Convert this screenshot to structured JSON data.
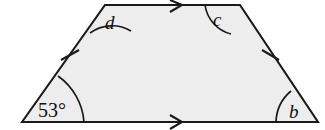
{
  "figure": {
    "kind": "isosceles-trapezoid",
    "fill_color": "#ededed",
    "stroke_color": "#1a1a1a",
    "background_color": "#ffffff",
    "vertices": {
      "bottom_left": {
        "x": 22,
        "y": 122
      },
      "top_left": {
        "x": 105,
        "y": 5
      },
      "top_right": {
        "x": 240,
        "y": 5
      },
      "bottom_right": {
        "x": 318,
        "y": 122
      }
    },
    "angles": [
      {
        "id": "bottom-left",
        "label": "53°",
        "known": true,
        "label_x": 38,
        "label_y": 117,
        "arc_radius": 62
      },
      {
        "id": "top-left",
        "label": "d",
        "known": false,
        "label_x": 105,
        "label_y": 29,
        "arc_radius": 37
      },
      {
        "id": "top-right",
        "label": "c",
        "known": false,
        "label_x": 213,
        "label_y": 26,
        "arc_radius": 35
      },
      {
        "id": "bottom-right",
        "label": "b",
        "known": false,
        "label_x": 289,
        "label_y": 118,
        "arc_radius": 42
      }
    ],
    "side_ticks": [
      {
        "id": "left-leg-tick",
        "x": 70,
        "y": 55,
        "count": 1
      },
      {
        "id": "right-leg-tick",
        "x": 270,
        "y": 55,
        "count": 1
      }
    ],
    "parallel_arrows": [
      {
        "id": "top-base-arrow",
        "x": 178,
        "y": 5,
        "direction": "right",
        "count": 1
      },
      {
        "id": "bottom-base-arrow",
        "x": 178,
        "y": 122,
        "direction": "right",
        "count": 1
      }
    ]
  }
}
